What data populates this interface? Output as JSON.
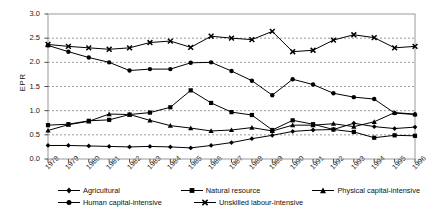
{
  "chart_data": {
    "type": "line",
    "title": "",
    "xlabel": "",
    "ylabel": "EPR",
    "ylim": [
      0.0,
      3.0
    ],
    "ytick_step": 0.5,
    "grid": true,
    "grid_axis": "y",
    "legend_position": "bottom",
    "categories": [
      "1978",
      "1979",
      "1980",
      "1981",
      "1982",
      "1983",
      "1984",
      "1985",
      "1986",
      "1987",
      "1988",
      "1989",
      "1990",
      "1991",
      "1992",
      "1993",
      "1994",
      "1995",
      "1996"
    ],
    "yticks": [
      "0.0",
      "0.5",
      "1.0",
      "1.5",
      "2.0",
      "2.5",
      "3.0"
    ],
    "series": [
      {
        "name": "Agricultural",
        "marker": "diamond",
        "color": "#000000",
        "values": [
          0.28,
          0.28,
          0.27,
          0.26,
          0.25,
          0.26,
          0.25,
          0.23,
          0.28,
          0.34,
          0.42,
          0.49,
          0.57,
          0.6,
          0.61,
          0.74,
          0.67,
          0.63,
          0.66
        ]
      },
      {
        "name": "Natural resource",
        "marker": "square",
        "color": "#000000",
        "values": [
          0.7,
          0.72,
          0.79,
          0.81,
          0.92,
          0.96,
          1.07,
          1.42,
          1.16,
          0.97,
          0.91,
          0.6,
          0.8,
          0.72,
          0.61,
          0.56,
          0.44,
          0.49,
          0.48
        ]
      },
      {
        "name": "Physical capital-intensive",
        "marker": "triangle",
        "color": "#000000",
        "values": [
          0.59,
          0.71,
          0.78,
          0.93,
          0.92,
          0.8,
          0.69,
          0.64,
          0.58,
          0.6,
          0.65,
          0.58,
          0.7,
          0.7,
          0.73,
          0.67,
          0.77,
          0.96,
          0.93
        ]
      },
      {
        "name": "Human capital-intensive",
        "marker": "circle",
        "color": "#000000",
        "values": [
          2.35,
          2.22,
          2.1,
          2.0,
          1.83,
          1.86,
          1.86,
          1.99,
          2.0,
          1.82,
          1.62,
          1.32,
          1.65,
          1.54,
          1.36,
          1.28,
          1.24,
          0.95,
          0.92
        ]
      },
      {
        "name": "Unskilled labour-intensive",
        "marker": "x",
        "color": "#000000",
        "values": [
          2.37,
          2.33,
          2.3,
          2.27,
          2.3,
          2.41,
          2.44,
          2.31,
          2.54,
          2.5,
          2.47,
          2.64,
          2.22,
          2.25,
          2.46,
          2.57,
          2.51,
          2.3,
          2.33
        ]
      }
    ]
  },
  "axes": {
    "y_axis_label": "EPR"
  }
}
